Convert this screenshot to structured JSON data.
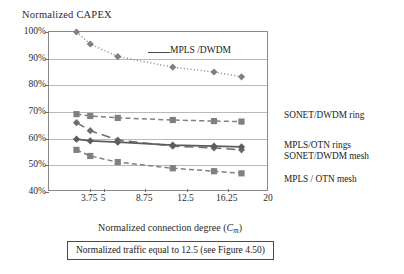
{
  "chart_data": {
    "type": "line",
    "title": "",
    "ylabel": "Normalized CAPEX",
    "xlabel": "Normalized connection degree (Cm)",
    "xlabel_main": "Normalized connection degree (",
    "xlabel_var": "C",
    "xlabel_sub": "m",
    "xlabel_close": ")",
    "ylim": [
      40,
      100
    ],
    "xlim": [
      0,
      20
    ],
    "yticks": [
      "40%",
      "50%",
      "60%",
      "70%",
      "80%",
      "90%",
      "100%"
    ],
    "ytick_values": [
      40,
      50,
      60,
      70,
      80,
      90,
      100
    ],
    "xticks": [
      "3.75",
      "5",
      "8.75",
      "12.5",
      "16.25",
      "20"
    ],
    "xtick_values": [
      3.75,
      5,
      8.75,
      12.5,
      16.25,
      20
    ],
    "grid": "horizontal",
    "legend_position": "right-of-plot-inline",
    "x": [
      2.5,
      3.75,
      6.25,
      11.25,
      15.0,
      17.5
    ],
    "series": [
      {
        "name": "MPLS /DWDM",
        "values": [
          100,
          95.5,
          90.8,
          86.8,
          85.0,
          83.2
        ],
        "style": "dotted",
        "marker": "diamond",
        "color": "#808080",
        "label_placement": "inside-plot"
      },
      {
        "name": "SONET/DWDM ring",
        "values": [
          69.2,
          68.5,
          67.8,
          67.0,
          66.6,
          66.4
        ],
        "style": "dashed",
        "marker": "square",
        "color": "#808080",
        "label_placement": "right"
      },
      {
        "name": "SONET/DWDM mesh",
        "values": [
          66.0,
          63.0,
          59.5,
          57.2,
          56.5,
          55.8
        ],
        "style": "long-dash",
        "marker": "diamond",
        "color": "#6e6e6e",
        "label_placement": "right"
      },
      {
        "name": "MPLS/OTN rings",
        "values": [
          59.8,
          59.2,
          58.7,
          57.6,
          57.2,
          56.9
        ],
        "style": "solid",
        "marker": "diamond",
        "color": "#5c5c5c",
        "label_placement": "right"
      },
      {
        "name": "MPLS / OTN mesh",
        "values": [
          55.8,
          53.5,
          51.2,
          48.9,
          47.8,
          47.0
        ],
        "style": "dashed",
        "marker": "square",
        "color": "#808080",
        "label_placement": "right"
      }
    ],
    "annotations": [
      {
        "text": "MPLS /DWDM",
        "x": 11.0,
        "y": 93.0
      }
    ],
    "right_labels": [
      {
        "text": "SONET/DWDM ring"
      },
      {
        "text": "MPLS/OTN rings"
      },
      {
        "text": "SONET/DWDM mesh"
      },
      {
        "text": "MPLS / OTN mesh"
      }
    ],
    "caption": "Normalized traffic equal to 12.5 (see Figure 4.50)"
  }
}
